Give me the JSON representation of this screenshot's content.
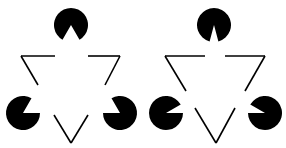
{
  "colors": {
    "background": "#ffffff",
    "ink": "#000000"
  },
  "figures": [
    {
      "name": "left-figure",
      "pacmen": [
        {
          "cx": 71,
          "cy": 25,
          "r": 17,
          "a1": 60,
          "a2": 120
        },
        {
          "cx": 23,
          "cy": 113,
          "r": 17,
          "a1": 300,
          "a2": 360
        },
        {
          "cx": 120,
          "cy": 113,
          "r": 17,
          "a1": 180,
          "a2": 240
        }
      ],
      "lines": [
        [
          [
            21,
            56
          ],
          [
            55,
            56
          ]
        ],
        [
          [
            21,
            56
          ],
          [
            38,
            85
          ]
        ],
        [
          [
            88,
            56
          ],
          [
            120,
            56
          ]
        ],
        [
          [
            120,
            56
          ],
          [
            105,
            85
          ]
        ],
        [
          [
            54,
            115
          ],
          [
            71,
            143
          ]
        ],
        [
          [
            71,
            143
          ],
          [
            88,
            115
          ]
        ]
      ]
    },
    {
      "name": "right-figure",
      "pacmen": [
        {
          "cx": 214,
          "cy": 25,
          "r": 17,
          "a1": 75,
          "a2": 105
        },
        {
          "cx": 166,
          "cy": 113,
          "r": 17,
          "a1": 330,
          "a2": 360
        },
        {
          "cx": 265,
          "cy": 113,
          "r": 17,
          "a1": 180,
          "a2": 210
        }
      ],
      "lines": [
        [
          [
            165,
            56
          ],
          [
            205,
            56
          ]
        ],
        [
          [
            165,
            56
          ],
          [
            186,
            91
          ]
        ],
        [
          [
            225,
            56
          ],
          [
            265,
            56
          ]
        ],
        [
          [
            265,
            56
          ],
          [
            245,
            91
          ]
        ],
        [
          [
            195,
            108
          ],
          [
            216,
            143
          ]
        ],
        [
          [
            216,
            143
          ],
          [
            235,
            108
          ]
        ]
      ]
    }
  ]
}
